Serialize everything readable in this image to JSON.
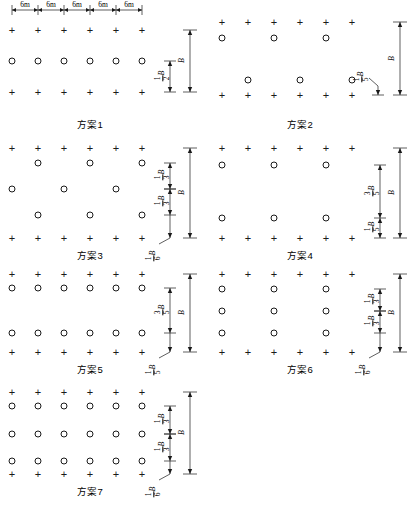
{
  "figure": {
    "units_label": "6m",
    "top_dimension_segments": [
      "6m",
      "6m",
      "6m",
      "6m",
      "6m"
    ],
    "symbol_legend": {
      "cross": "+",
      "circle": "o"
    }
  },
  "colors": {
    "ink": "#1a1a1a",
    "line": "#555555",
    "background": "#ffffff"
  },
  "schemes": [
    {
      "id": 1,
      "caption": "方案1",
      "cross_rows": 2,
      "circle_rows": [
        {
          "columns": [
            1,
            2,
            3,
            4,
            5,
            6
          ]
        }
      ],
      "dimensions": [
        {
          "label_num": "1",
          "label_den": "2",
          "label_var": "B",
          "text": "1/2 B",
          "kind": "inner"
        },
        {
          "label_num": "",
          "label_den": "",
          "label_var": "B",
          "text": "B",
          "kind": "outer"
        }
      ]
    },
    {
      "id": 2,
      "caption": "方案2",
      "cross_rows": 2,
      "circle_rows": [
        {
          "columns": [
            1,
            3,
            5
          ]
        },
        {
          "columns": [
            2,
            4,
            6
          ]
        }
      ],
      "dimensions": [
        {
          "label_num": "1",
          "label_den": "5",
          "label_var": "B",
          "text": "1/5 B",
          "kind": "leader"
        },
        {
          "label_num": "",
          "label_den": "",
          "label_var": "B",
          "text": "B",
          "kind": "outer"
        }
      ]
    },
    {
      "id": 3,
      "caption": "方案3",
      "cross_rows": 2,
      "circle_rows": [
        {
          "columns": [
            2,
            4,
            6
          ]
        },
        {
          "columns": [
            1,
            3,
            5
          ]
        },
        {
          "columns": [
            2,
            4,
            6
          ]
        }
      ],
      "dimensions": [
        {
          "label_num": "1",
          "label_den": "3",
          "label_var": "B",
          "text": "1/3 B",
          "kind": "inner"
        },
        {
          "label_num": "1",
          "label_den": "3",
          "label_var": "B",
          "text": "1/3 B",
          "kind": "inner"
        },
        {
          "label_num": "1",
          "label_den": "6",
          "label_var": "B",
          "text": "1/6 B",
          "kind": "leader"
        },
        {
          "label_num": "",
          "label_den": "",
          "label_var": "B",
          "text": "B",
          "kind": "outer"
        }
      ]
    },
    {
      "id": 4,
      "caption": "方案4",
      "cross_rows": 2,
      "circle_rows": [
        {
          "columns": [
            1,
            3,
            5
          ]
        },
        {
          "columns": [
            1,
            3,
            5
          ]
        }
      ],
      "dimensions": [
        {
          "label_num": "3",
          "label_den": "5",
          "label_var": "B",
          "text": "3/5 B",
          "kind": "inner"
        },
        {
          "label_num": "1",
          "label_den": "5",
          "label_var": "B",
          "text": "1/5 B",
          "kind": "inner"
        },
        {
          "label_num": "",
          "label_den": "",
          "label_var": "B",
          "text": "B",
          "kind": "outer"
        }
      ]
    },
    {
      "id": 5,
      "caption": "方案5",
      "cross_rows": 2,
      "circle_rows": [
        {
          "columns": [
            1,
            2,
            3,
            4,
            5,
            6
          ]
        },
        {
          "columns": [
            1,
            2,
            3,
            4,
            5,
            6
          ]
        }
      ],
      "dimensions": [
        {
          "label_num": "3",
          "label_den": "5",
          "label_var": "B",
          "text": "3/5 B",
          "kind": "inner"
        },
        {
          "label_num": "1",
          "label_den": "5",
          "label_var": "B",
          "text": "1/5 B",
          "kind": "leader"
        },
        {
          "label_num": "",
          "label_den": "",
          "label_var": "B",
          "text": "B",
          "kind": "outer"
        }
      ]
    },
    {
      "id": 6,
      "caption": "方案6",
      "cross_rows": 2,
      "circle_rows": [
        {
          "columns": [
            1,
            3,
            5
          ]
        },
        {
          "columns": [
            1,
            3,
            5
          ]
        },
        {
          "columns": [
            1,
            3,
            5
          ]
        }
      ],
      "dimensions": [
        {
          "label_num": "1",
          "label_den": "3",
          "label_var": "B",
          "text": "1/3 B",
          "kind": "inner"
        },
        {
          "label_num": "1",
          "label_den": "3",
          "label_var": "B",
          "text": "1/3 B",
          "kind": "inner"
        },
        {
          "label_num": "1",
          "label_den": "6",
          "label_var": "B",
          "text": "1/6 B",
          "kind": "leader"
        },
        {
          "label_num": "",
          "label_den": "",
          "label_var": "B",
          "text": "B",
          "kind": "outer"
        }
      ]
    },
    {
      "id": 7,
      "caption": "方案7",
      "cross_rows": 2,
      "circle_rows": [
        {
          "columns": [
            1,
            2,
            3,
            4,
            5,
            6
          ]
        },
        {
          "columns": [
            1,
            2,
            3,
            4,
            5,
            6
          ]
        },
        {
          "columns": [
            1,
            2,
            3,
            4,
            5,
            6
          ]
        }
      ],
      "dimensions": [
        {
          "label_num": "1",
          "label_den": "3",
          "label_var": "B",
          "text": "1/3 B",
          "kind": "inner"
        },
        {
          "label_num": "1",
          "label_den": "3",
          "label_var": "B",
          "text": "1/3 B",
          "kind": "inner"
        },
        {
          "label_num": "1",
          "label_den": "6",
          "label_var": "B",
          "text": "1/6 B",
          "kind": "leader"
        },
        {
          "label_num": "",
          "label_den": "",
          "label_var": "B",
          "text": "B",
          "kind": "outer"
        }
      ]
    }
  ]
}
